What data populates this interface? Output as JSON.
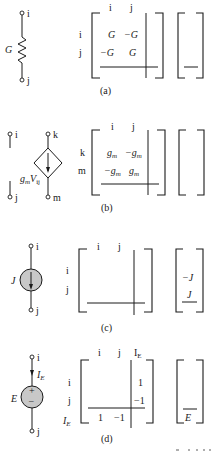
{
  "colors": {
    "ink": "#1a1a1a",
    "source_fill": "#c8c8c8",
    "background": "#ffffff"
  },
  "panels": [
    {
      "id": "a",
      "caption": "(a)",
      "element": {
        "type": "conductance",
        "label": "G",
        "terminals": [
          "i",
          "j"
        ]
      },
      "matrix": {
        "col_headers": [
          "i",
          "j"
        ],
        "row_labels": [
          "i",
          "j"
        ],
        "cells": [
          [
            "G",
            "−G"
          ],
          [
            "−G",
            "G"
          ]
        ]
      },
      "rhs": []
    },
    {
      "id": "b",
      "caption": "(b)",
      "element": {
        "type": "vccs",
        "label": "g",
        "label_sub": "m",
        "label_v": "V",
        "label_vsub": "ij",
        "terminals": [
          "i",
          "j",
          "k",
          "m"
        ]
      },
      "matrix": {
        "col_headers": [
          "i",
          "j"
        ],
        "row_labels": [
          "k",
          "m"
        ],
        "cells": [
          [
            "g",
            "−g"
          ],
          [
            "−g",
            "g"
          ]
        ],
        "cell_sub": "m"
      },
      "rhs": []
    },
    {
      "id": "c",
      "caption": "(c)",
      "element": {
        "type": "current_source",
        "label": "J",
        "terminals": [
          "i",
          "j"
        ]
      },
      "matrix": {
        "col_headers": [
          "i",
          "j"
        ],
        "row_labels": [
          "i",
          "j"
        ],
        "cells": []
      },
      "rhs": [
        "−J",
        "J"
      ]
    },
    {
      "id": "d",
      "caption": "(d)",
      "element": {
        "type": "voltage_source",
        "label": "E",
        "current_label": "I",
        "current_sub": "E",
        "plus": "+",
        "minus": "−",
        "terminals": [
          "i",
          "j"
        ]
      },
      "matrix": {
        "col_headers": [
          "i",
          "j",
          "I"
        ],
        "col_header_sub": "E",
        "row_labels": [
          "i",
          "j",
          "I"
        ],
        "row_label_sub": "E",
        "cells": [
          [
            "",
            "",
            "1"
          ],
          [
            "",
            "",
            "−1"
          ],
          [
            "1",
            "−1",
            ""
          ]
        ]
      },
      "rhs": [
        "",
        "",
        "E"
      ]
    }
  ]
}
